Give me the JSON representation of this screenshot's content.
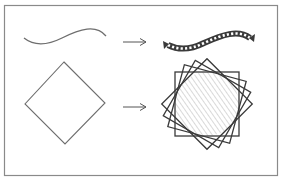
{
  "diagram": {
    "frame": {
      "x": 4.5,
      "y": 5.5,
      "width": 273,
      "height": 170,
      "stroke": "#8a8a8a"
    },
    "colors": {
      "input_stroke": "#6e6e6e",
      "output_stroke": "#3a3a3a",
      "arrow_stroke": "#555555",
      "hatch": "#cfcfcf"
    },
    "rows": [
      {
        "name": "wave-row",
        "input": {
          "shape": "wavy-curve",
          "path": "M24,38 C34,46 46,46 62,38 C80,29 96,24 106,36"
        },
        "arrow": {
          "from": [
            123,
            42
          ],
          "to": [
            146,
            42
          ]
        },
        "output": {
          "shape": "dashed-decorated-wave",
          "path": "M168,45 C178,50 190,50 204,43 C222,35 238,29 250,38"
        }
      },
      {
        "name": "diamond-row",
        "input": {
          "shape": "diamond",
          "points": "64,62 105,103 65,144 25,104"
        },
        "arrow": {
          "from": [
            123,
            107
          ],
          "to": [
            146,
            107
          ]
        },
        "output": {
          "shape": "rotated-squares-star",
          "center": [
            207,
            104
          ],
          "half_size": 32,
          "rotations": [
            0,
            15,
            30,
            45
          ],
          "hatch_radius": 32
        }
      }
    ]
  }
}
